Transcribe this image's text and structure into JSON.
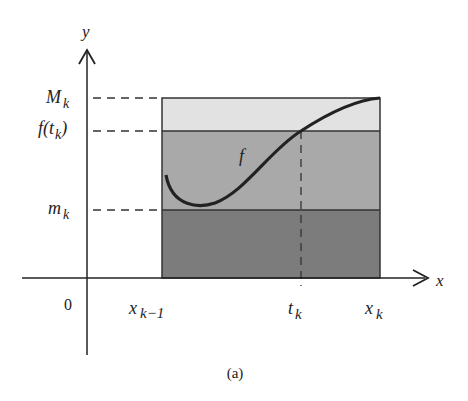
{
  "figure": {
    "caption": "(a)",
    "colors": {
      "upper_band": "#e2e2e2",
      "middle_band": "#a9a9a9",
      "lower_band": "#7c7c7c",
      "ink": "#222222"
    },
    "axes": {
      "x_label": "x",
      "y_label": "y",
      "origin_label": "0"
    },
    "y_labels": {
      "M": {
        "base": "M",
        "sub": "k"
      },
      "f_t": {
        "prefix": "f(",
        "var": "t",
        "sub": "k",
        "suffix": ")"
      },
      "m": {
        "base": "m",
        "sub": "k"
      }
    },
    "x_labels": {
      "x_prev": {
        "base": "x",
        "sub": "k−1"
      },
      "t": {
        "base": "t",
        "sub": "k"
      },
      "x_k": {
        "base": "x",
        "sub": "k"
      }
    },
    "curve_label": "f"
  }
}
